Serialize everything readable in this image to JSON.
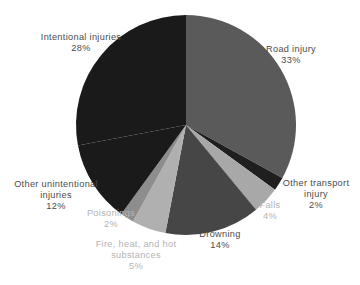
{
  "chart_data": {
    "type": "pie",
    "title": "",
    "subtitle": "",
    "xlabel": "",
    "ylabel": "",
    "legend_position": "none",
    "grid": false,
    "unit": "%",
    "start_angle_deg": 0,
    "direction": "clockwise",
    "categories": [
      "Road injury",
      "Other transport injury",
      "Falls",
      "Drowning",
      "Fire, heat, and hot substances",
      "Poisonings",
      "Other unintentional injuries",
      "Intentional injuries"
    ],
    "values": [
      33,
      2,
      4,
      14,
      5,
      2,
      12,
      28
    ],
    "slices": [
      {
        "id": "road-injury",
        "label": "Road injury",
        "label_lines": [
          "Road injury"
        ],
        "value": 33,
        "value_text": "33%",
        "color": "#5a5a5a",
        "label_color": "#4b4b4b"
      },
      {
        "id": "other-transport-injury",
        "label": "Other transport injury",
        "label_lines": [
          "Other transport",
          "injury"
        ],
        "value": 2,
        "value_text": "2%",
        "color": "#1f1f1f",
        "label_color": "#4b4b4b"
      },
      {
        "id": "falls",
        "label": "Falls",
        "label_lines": [
          "Falls"
        ],
        "value": 4,
        "value_text": "4%",
        "color": "#a8a8a8",
        "label_color": "#b3b3b3"
      },
      {
        "id": "drowning",
        "label": "Drowning",
        "label_lines": [
          "Drowning"
        ],
        "value": 14,
        "value_text": "14%",
        "color": "#464646",
        "label_color": "#4b4b4b"
      },
      {
        "id": "fire-heat-and-hot-substances",
        "label": "Fire, heat, and hot substances",
        "label_lines": [
          "Fire, heat, and hot",
          "substances"
        ],
        "value": 5,
        "value_text": "5%",
        "color": "#b0b0b0",
        "label_color": "#b3b3b3"
      },
      {
        "id": "poisonings",
        "label": "Poisonings",
        "label_lines": [
          "Poisonings"
        ],
        "value": 2,
        "value_text": "2%",
        "color": "#8d8d8d",
        "label_color": "#b3b3b3"
      },
      {
        "id": "other-unintentional-injuries",
        "label": "Other unintentional injuries",
        "label_lines": [
          "Other unintentional",
          "injuries"
        ],
        "value": 12,
        "value_text": "12%",
        "color": "#1a1a1a",
        "label_color": "#4b4b4b"
      },
      {
        "id": "intentional-injuries",
        "label": "Intentional injuries",
        "label_lines": [
          "Intentional injuries"
        ],
        "value": 28,
        "value_text": "28%",
        "color": "#1a1a1a",
        "label_color": "#4b4b4b"
      }
    ],
    "geometry": {
      "center_x": 186,
      "center_y": 125,
      "radius": 110
    }
  },
  "labels": {
    "intentional_injuries": {
      "line1": "Intentional injuries",
      "value": "28%"
    },
    "road_injury": {
      "line1": "Road injury",
      "value": "33%"
    },
    "other_transport_injury": {
      "line1": "Other transport",
      "line2": "injury",
      "value": "2%"
    },
    "falls": {
      "line1": "Falls",
      "value": "4%"
    },
    "drowning": {
      "line1": "Drowning",
      "value": "14%"
    },
    "fire_heat_hot_substances": {
      "line1": "Fire, heat, and hot",
      "line2": "substances",
      "value": "5%"
    },
    "poisonings": {
      "line1": "Poisonings",
      "value": "2%"
    },
    "other_unintentional_injuries": {
      "line1": "Other unintentional",
      "line2": "injuries",
      "value": "12%"
    }
  }
}
